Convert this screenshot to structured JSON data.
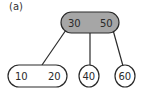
{
  "figure_label": "(a)",
  "tree": {
    "type": "2-3 tree",
    "root": {
      "keys": [
        "30",
        "50"
      ],
      "fill": "#a6a6a6"
    },
    "children": [
      {
        "keys": [
          "10",
          "20"
        ],
        "fill": "#ffffff"
      },
      {
        "keys": [
          "40"
        ],
        "fill": "#ffffff"
      },
      {
        "keys": [
          "60"
        ],
        "fill": "#ffffff"
      }
    ]
  },
  "colors": {
    "stroke": "#2a2a2a",
    "root_fill": "#a6a6a6",
    "leaf_fill": "#ffffff"
  }
}
